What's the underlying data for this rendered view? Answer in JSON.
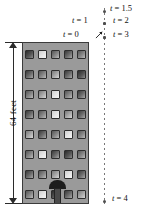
{
  "figure": {
    "dimension": {
      "label": "64 feet",
      "value": 64,
      "unit": "feet"
    },
    "building": {
      "floors": 8,
      "windows_per_floor": 5,
      "door": "front-door",
      "window_shades": [
        [
          "w-e",
          "w-b",
          "w-c",
          "w-a",
          "w-c"
        ],
        [
          "w-a",
          "w-c",
          "w-d",
          "w-a",
          "w-e"
        ],
        [
          "w-c",
          "w-d",
          "w-b",
          "w-c",
          "w-a"
        ],
        [
          "w-a",
          "w-c",
          "w-b",
          "w-d",
          "w-a"
        ],
        [
          "w-d",
          "w-a",
          "w-c",
          "w-b",
          "w-c"
        ],
        [
          "w-c",
          "w-b",
          "w-a",
          "w-e",
          "w-c"
        ],
        [
          "w-a",
          "w-c",
          "w-d",
          "w-b",
          "w-a"
        ],
        [
          "w-c",
          "w-b",
          "w-e",
          "w-a",
          "w-d"
        ]
      ]
    },
    "trajectory": {
      "line_style": "dashed",
      "markers": [
        {
          "label": "t = 1.5",
          "t": 1.5,
          "y": 10,
          "side": "right",
          "label_x": 110,
          "label_y": 3
        },
        {
          "label": "t = 1",
          "t": 1,
          "y": 22,
          "side": "left",
          "label_x": 72,
          "label_y": 15
        },
        {
          "label": "t = 2",
          "t": 2,
          "y": 22,
          "side": "right",
          "label_x": 113,
          "label_y": 15
        },
        {
          "label": "t = 0",
          "t": 0,
          "y": 36,
          "side": "left",
          "label_x": 63,
          "label_y": 29
        },
        {
          "label": "t = 3",
          "t": 3,
          "y": 36,
          "side": "right",
          "label_x": 113,
          "label_y": 29
        },
        {
          "label": "t = 4",
          "t": 4,
          "y": 200,
          "side": "right",
          "label_x": 112,
          "label_y": 193
        }
      ]
    },
    "colors": {
      "building_wall": "#9a9a9a",
      "outline": "#3b3b3b",
      "dashed_line": "#777777",
      "marker": "#4d4d4d",
      "text": "#111111",
      "background": "#ffffff"
    }
  }
}
